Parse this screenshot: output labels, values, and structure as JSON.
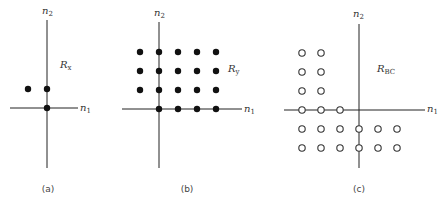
{
  "panels": [
    {
      "id": "a",
      "caption": "(a)",
      "region_label": "R",
      "region_sub": "x",
      "axis_h_label": "n",
      "axis_h_sub": "1",
      "axis_v_label": "n",
      "axis_v_sub": "2",
      "marker": "filled",
      "points": [
        [
          -1,
          1
        ],
        [
          0,
          1
        ],
        [
          0,
          0
        ]
      ]
    },
    {
      "id": "b",
      "caption": "(b)",
      "region_label": "R",
      "region_sub": "y",
      "axis_h_label": "n",
      "axis_h_sub": "1",
      "axis_v_label": "n",
      "axis_v_sub": "2",
      "marker": "filled",
      "points": [
        [
          -1,
          3
        ],
        [
          0,
          3
        ],
        [
          1,
          3
        ],
        [
          2,
          3
        ],
        [
          3,
          3
        ],
        [
          -1,
          2
        ],
        [
          0,
          2
        ],
        [
          1,
          2
        ],
        [
          2,
          2
        ],
        [
          3,
          2
        ],
        [
          -1,
          1
        ],
        [
          0,
          1
        ],
        [
          1,
          1
        ],
        [
          2,
          1
        ],
        [
          3,
          1
        ],
        [
          0,
          0
        ],
        [
          1,
          0
        ],
        [
          2,
          0
        ],
        [
          3,
          0
        ]
      ]
    },
    {
      "id": "c",
      "caption": "(c)",
      "region_label": "R",
      "region_sub": "BC",
      "axis_h_label": "n",
      "axis_h_sub": "1",
      "axis_v_label": "n",
      "axis_v_sub": "2",
      "marker": "open",
      "points": [
        [
          -3,
          3
        ],
        [
          -2,
          3
        ],
        [
          -3,
          2
        ],
        [
          -2,
          2
        ],
        [
          -3,
          1
        ],
        [
          -2,
          1
        ],
        [
          -3,
          0
        ],
        [
          -2,
          0
        ],
        [
          -1,
          0
        ],
        [
          -3,
          -1
        ],
        [
          -2,
          -1
        ],
        [
          -1,
          -1
        ],
        [
          0,
          -1
        ],
        [
          1,
          -1
        ],
        [
          2,
          -1
        ],
        [
          -3,
          -2
        ],
        [
          -2,
          -2
        ],
        [
          -1,
          -2
        ],
        [
          0,
          -2
        ],
        [
          1,
          -2
        ],
        [
          2,
          -2
        ]
      ]
    }
  ]
}
